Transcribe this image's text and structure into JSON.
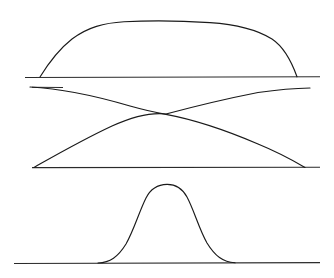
{
  "figure": {
    "background_color": "#ffffff",
    "stroke_color": "#1a1a1a",
    "baseline_color": "#2a2a2a",
    "stroke_width": 1.15,
    "width": 334,
    "height": 278
  },
  "chart_data": {
    "type": "line",
    "xlabel": "",
    "ylabel": "",
    "grid": false,
    "legend": "none",
    "xlim": [
      0,
      334
    ],
    "ylim": [
      278,
      0
    ],
    "panels": [
      {
        "name": "plateau-curve-panel",
        "label": "Wide flat-topped plateau curve",
        "baseline_y": 77,
        "baseline_x_start": 25,
        "baseline_x_end": 320,
        "curve_foot_left_x": 40,
        "curve_foot_right_x": 297,
        "curve_peak_y": 22,
        "curve_peak_x_start": 120,
        "curve_peak_x_end": 215
      },
      {
        "name": "crossing-curves-panel",
        "label": "Two crossing sigmoid curves forming an X",
        "upper_baseline_y": 87,
        "lower_baseline_y": 167,
        "baseline_x_start": 32,
        "baseline_x_end": 320,
        "crossing_point_x": 165,
        "crossing_point_y": 114,
        "descending_start_x": 30,
        "descending_start_y": 87,
        "descending_end_x": 305,
        "descending_end_y": 167,
        "ascending_start_x": 34,
        "ascending_start_y": 167,
        "ascending_end_x": 310,
        "ascending_end_y": 88
      },
      {
        "name": "bell-bump-panel",
        "label": "Narrow bell-shaped bump",
        "baseline_y": 263,
        "baseline_x_start": 14,
        "baseline_x_end": 320,
        "bump_foot_left_x": 98,
        "bump_foot_right_x": 235,
        "bump_peak_y": 185,
        "bump_peak_x_start": 150,
        "bump_peak_x_end": 183,
        "bump_center_x": 166
      }
    ]
  }
}
